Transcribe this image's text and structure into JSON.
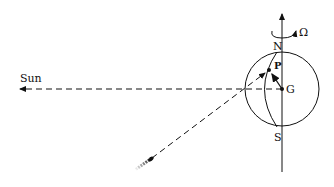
{
  "labels": {
    "sun": "Sun",
    "north": "N",
    "south": "S",
    "center": "G",
    "point": "P",
    "rotation": "Ω"
  },
  "colors": {
    "ink": "#111111",
    "background": "#ffffff"
  }
}
